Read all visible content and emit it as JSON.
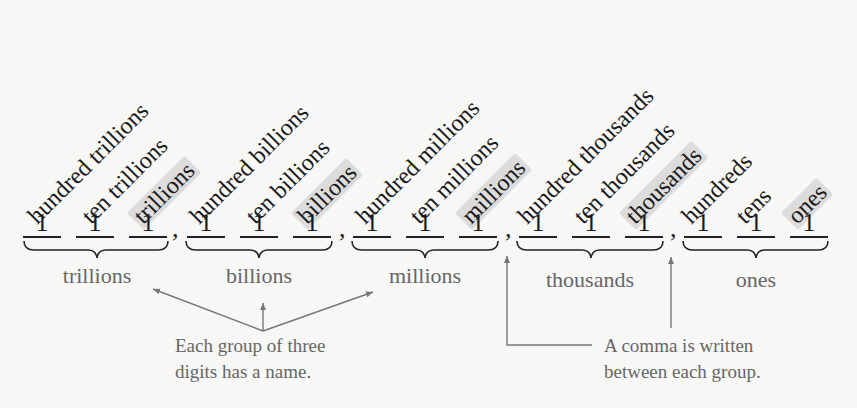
{
  "place_values": [
    {
      "label": "hundred trillions",
      "highlight": false
    },
    {
      "label": "ten trillions",
      "highlight": false
    },
    {
      "label": "trillions",
      "highlight": true
    },
    {
      "label": "hundred billions",
      "highlight": false
    },
    {
      "label": "ten billions",
      "highlight": false
    },
    {
      "label": "billions",
      "highlight": true
    },
    {
      "label": "hundred millions",
      "highlight": false
    },
    {
      "label": "ten millions",
      "highlight": false
    },
    {
      "label": "millions",
      "highlight": true
    },
    {
      "label": "hundred thousands",
      "highlight": false
    },
    {
      "label": "ten thousands",
      "highlight": false
    },
    {
      "label": "thousands",
      "highlight": true
    },
    {
      "label": "hundreds",
      "highlight": false
    },
    {
      "label": "tens",
      "highlight": false
    },
    {
      "label": "ones",
      "highlight": true
    }
  ],
  "digits": [
    "1",
    "1",
    "1",
    "1",
    "1",
    "1",
    "1",
    "1",
    "1",
    "1",
    "1",
    "1",
    "1",
    "1",
    "1"
  ],
  "separator": ",",
  "groups": [
    {
      "label": "trillions"
    },
    {
      "label": "billions"
    },
    {
      "label": "millions"
    },
    {
      "label": "thousands"
    },
    {
      "label": "ones"
    }
  ],
  "annotations": {
    "group_name_note": {
      "line1": "Each group of three",
      "line2": "digits has a name."
    },
    "comma_note": {
      "line1": "A comma is written",
      "line2": "between each group."
    }
  },
  "colors": {
    "background": "#f7f7f5",
    "text": "#1a1a1a",
    "secondary_text": "#666666",
    "highlight": "#dcdcdc",
    "arrow": "#777777"
  }
}
